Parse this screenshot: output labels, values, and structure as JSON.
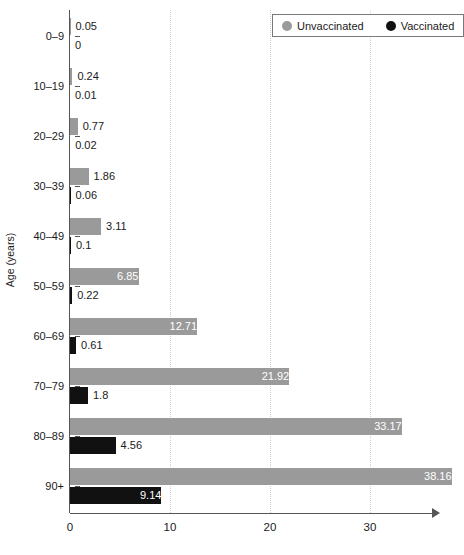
{
  "chart_data": {
    "type": "bar",
    "orientation": "horizontal",
    "title": "",
    "xlabel": "",
    "ylabel": "Age (years)",
    "categories": [
      "0–9",
      "10–19",
      "20–29",
      "30–39",
      "40–49",
      "50–59",
      "60–69",
      "70–79",
      "80–89",
      "90+"
    ],
    "series": [
      {
        "name": "Unvaccinated",
        "color": "#9a9a9a",
        "values": [
          0.05,
          0.24,
          0.77,
          1.86,
          3.11,
          6.85,
          12.71,
          21.92,
          33.17,
          38.16
        ],
        "labels": [
          "0.05",
          "0.24",
          "0.77",
          "1.86",
          "3.11",
          "6.85",
          "12.71",
          "21.92",
          "33.17",
          "38.16"
        ]
      },
      {
        "name": "Vaccinated",
        "color": "#111111",
        "values": [
          0,
          0.01,
          0.02,
          0.06,
          0.1,
          0.22,
          0.61,
          1.8,
          4.56,
          9.14
        ],
        "labels": [
          "0",
          "0.01",
          "0.02",
          "0.06",
          "0.1",
          "0.22",
          "0.61",
          "1.8",
          "4.56",
          "9.14"
        ]
      }
    ],
    "xlim": [
      0,
      36.5
    ],
    "x_ticks": [
      "0",
      "10",
      "20",
      "30"
    ],
    "x_tick_values": [
      0,
      10,
      20,
      30
    ],
    "grid": "vertical-dotted",
    "legend_position": "top-right"
  },
  "legend": {
    "entries": [
      {
        "label": "Unvaccinated",
        "color": "#9a9a9a"
      },
      {
        "label": "Vaccinated",
        "color": "#111111"
      }
    ]
  },
  "axes": {
    "y_title": "Age (years)"
  }
}
